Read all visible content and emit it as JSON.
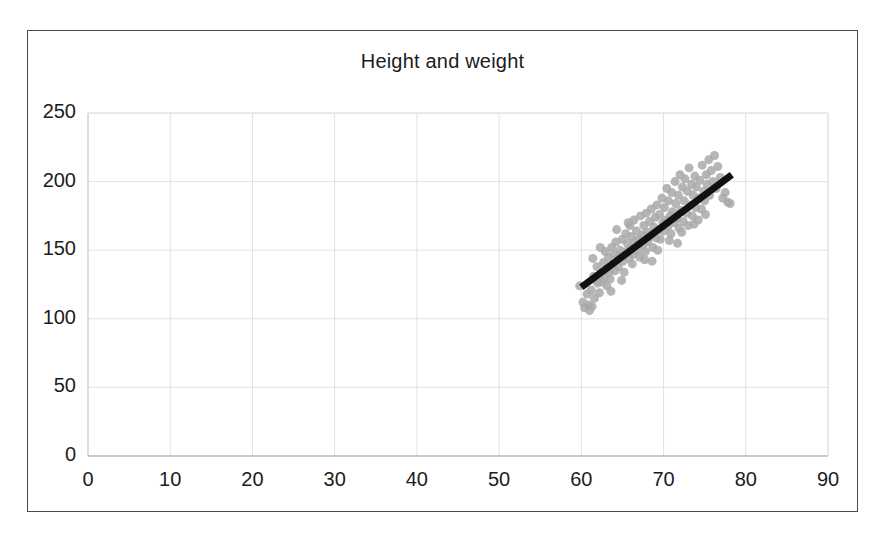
{
  "figure": {
    "background_color": "#ffffff",
    "frame_color": "#4a4a4a"
  },
  "chart_data": {
    "type": "scatter",
    "title": "Height and weight",
    "xlabel": "",
    "ylabel": "",
    "xlim": [
      0,
      90
    ],
    "ylim": [
      0,
      250
    ],
    "xticks": [
      0,
      10,
      20,
      30,
      40,
      50,
      60,
      70,
      80,
      90
    ],
    "yticks": [
      0,
      50,
      100,
      150,
      200,
      250
    ],
    "grid": true,
    "grid_color": "#e2e2e2",
    "legend": null,
    "marker": {
      "shape": "circle",
      "color": "#a9a9a9",
      "size_px": 9,
      "opacity": 0.85
    },
    "trendline": {
      "type": "linear",
      "color": "#111111",
      "width_px": 7,
      "x_start": 60.0,
      "y_start": 123.0,
      "x_end": 78.3,
      "y_end": 205.0
    },
    "points": [
      [
        59.8,
        124.0
      ],
      [
        60.2,
        112.0
      ],
      [
        60.4,
        108.0
      ],
      [
        60.7,
        118.0
      ],
      [
        60.9,
        110.0
      ],
      [
        61.0,
        106.0
      ],
      [
        61.2,
        121.0
      ],
      [
        61.3,
        109.0
      ],
      [
        61.5,
        131.0
      ],
      [
        61.6,
        115.0
      ],
      [
        61.8,
        128.0
      ],
      [
        61.9,
        138.0
      ],
      [
        62.0,
        126.0
      ],
      [
        62.2,
        119.0
      ],
      [
        62.4,
        133.0
      ],
      [
        62.5,
        127.0
      ],
      [
        62.7,
        141.0
      ],
      [
        62.8,
        130.0
      ],
      [
        63.0,
        136.0
      ],
      [
        63.1,
        124.0
      ],
      [
        63.3,
        145.0
      ],
      [
        63.4,
        134.0
      ],
      [
        63.5,
        129.0
      ],
      [
        63.7,
        152.0
      ],
      [
        63.8,
        140.0
      ],
      [
        64.0,
        147.0
      ],
      [
        64.1,
        135.0
      ],
      [
        64.2,
        156.0
      ],
      [
        64.4,
        143.0
      ],
      [
        64.5,
        138.0
      ],
      [
        64.7,
        150.0
      ],
      [
        64.8,
        146.0
      ],
      [
        65.0,
        158.0
      ],
      [
        65.1,
        142.0
      ],
      [
        65.2,
        134.0
      ],
      [
        65.4,
        162.0
      ],
      [
        65.5,
        149.0
      ],
      [
        65.6,
        155.0
      ],
      [
        65.8,
        144.0
      ],
      [
        65.9,
        168.0
      ],
      [
        66.0,
        151.0
      ],
      [
        66.1,
        160.0
      ],
      [
        66.3,
        147.0
      ],
      [
        66.4,
        172.0
      ],
      [
        66.5,
        156.0
      ],
      [
        66.7,
        164.0
      ],
      [
        66.8,
        150.0
      ],
      [
        67.0,
        158.0
      ],
      [
        67.1,
        145.0
      ],
      [
        67.2,
        175.0
      ],
      [
        67.4,
        161.0
      ],
      [
        67.5,
        154.0
      ],
      [
        67.6,
        168.0
      ],
      [
        67.8,
        149.0
      ],
      [
        67.9,
        177.0
      ],
      [
        68.0,
        163.0
      ],
      [
        68.1,
        156.0
      ],
      [
        68.3,
        171.0
      ],
      [
        68.4,
        160.0
      ],
      [
        68.5,
        180.0
      ],
      [
        68.7,
        152.0
      ],
      [
        68.8,
        167.0
      ],
      [
        69.0,
        174.0
      ],
      [
        69.1,
        159.0
      ],
      [
        69.2,
        183.0
      ],
      [
        69.4,
        165.0
      ],
      [
        69.5,
        176.0
      ],
      [
        69.6,
        158.0
      ],
      [
        69.8,
        188.0
      ],
      [
        69.9,
        170.0
      ],
      [
        70.0,
        164.0
      ],
      [
        70.1,
        181.0
      ],
      [
        70.3,
        172.0
      ],
      [
        70.4,
        195.0
      ],
      [
        70.5,
        167.0
      ],
      [
        70.6,
        186.0
      ],
      [
        70.8,
        175.0
      ],
      [
        70.9,
        162.0
      ],
      [
        71.0,
        192.0
      ],
      [
        71.1,
        178.0
      ],
      [
        71.3,
        170.0
      ],
      [
        71.4,
        200.0
      ],
      [
        71.5,
        184.0
      ],
      [
        71.6,
        173.0
      ],
      [
        71.8,
        190.0
      ],
      [
        71.9,
        166.0
      ],
      [
        72.0,
        205.0
      ],
      [
        72.1,
        179.0
      ],
      [
        72.3,
        196.0
      ],
      [
        72.4,
        171.0
      ],
      [
        72.5,
        186.0
      ],
      [
        72.6,
        202.0
      ],
      [
        72.8,
        177.0
      ],
      [
        72.9,
        193.0
      ],
      [
        73.0,
        168.0
      ],
      [
        73.1,
        210.0
      ],
      [
        73.3,
        183.0
      ],
      [
        73.4,
        198.0
      ],
      [
        73.5,
        175.0
      ],
      [
        73.6,
        190.0
      ],
      [
        73.8,
        204.0
      ],
      [
        73.9,
        181.0
      ],
      [
        74.0,
        196.0
      ],
      [
        74.2,
        172.0
      ],
      [
        74.3,
        188.0
      ],
      [
        74.4,
        201.0
      ],
      [
        74.6,
        180.0
      ],
      [
        74.7,
        212.0
      ],
      [
        74.9,
        193.0
      ],
      [
        75.0,
        186.0
      ],
      [
        75.2,
        205.0
      ],
      [
        75.3,
        198.0
      ],
      [
        75.5,
        216.0
      ],
      [
        75.6,
        190.0
      ],
      [
        75.8,
        208.0
      ],
      [
        76.0,
        200.0
      ],
      [
        76.2,
        219.0
      ],
      [
        76.4,
        195.0
      ],
      [
        76.6,
        211.0
      ],
      [
        76.9,
        203.0
      ],
      [
        77.2,
        188.0
      ],
      [
        77.5,
        192.0
      ],
      [
        77.8,
        185.0
      ],
      [
        78.1,
        184.0
      ],
      [
        62.3,
        152.0
      ],
      [
        63.6,
        120.0
      ],
      [
        64.9,
        128.0
      ],
      [
        66.2,
        140.0
      ],
      [
        67.7,
        143.0
      ],
      [
        69.3,
        150.0
      ],
      [
        70.7,
        157.0
      ],
      [
        72.2,
        163.0
      ],
      [
        73.7,
        169.0
      ],
      [
        75.1,
        176.0
      ],
      [
        61.4,
        144.0
      ],
      [
        62.9,
        149.0
      ],
      [
        64.3,
        165.0
      ],
      [
        65.7,
        170.0
      ],
      [
        68.6,
        142.0
      ],
      [
        71.7,
        155.0
      ]
    ]
  }
}
